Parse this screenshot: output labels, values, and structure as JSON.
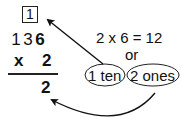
{
  "problem": {
    "carry_digit": "1",
    "multiplicand_digits": [
      "1",
      "3",
      "6"
    ],
    "operator": "x",
    "multiplier": "2",
    "partial_result": "2"
  },
  "explanation": {
    "equation": "2 x 6 = 12",
    "connector": "or",
    "tens_label": "1 ten",
    "ones_label": "2 ones"
  },
  "arrows": [
    {
      "from": "tens-oval",
      "to": "carry-box",
      "meaning": "carry 1 ten"
    },
    {
      "from": "ones-oval",
      "to": "result-ones-digit",
      "meaning": "write 2 ones"
    }
  ],
  "colors": {
    "ink": "#111111",
    "background": "#ffffff"
  }
}
